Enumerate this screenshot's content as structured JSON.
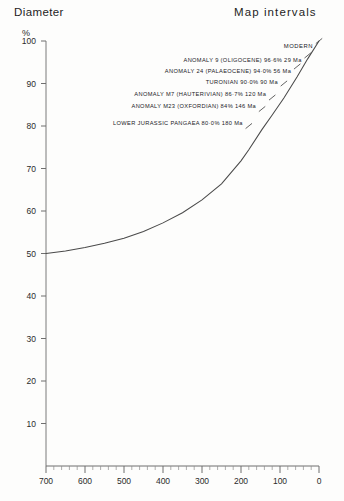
{
  "headings": {
    "left": "Diameter",
    "right": "Map  intervals"
  },
  "axes": {
    "y_unit": "%",
    "y_ticks": [
      "100",
      "90",
      "80",
      "70",
      "60",
      "50",
      "40",
      "30",
      "20",
      "10"
    ],
    "x_ticks": [
      "700",
      "600",
      "500",
      "400",
      "300",
      "200",
      "100",
      "0"
    ]
  },
  "annotations": [
    {
      "label": "MODERN",
      "marker": "tick-mark"
    },
    {
      "label": "ANOMALY 9 (OLIGOCENE) 96·6% 29 Ma",
      "marker": "tick-mark"
    },
    {
      "label": "ANOMALY 24 (PALAEOCENE) 94·0% 56 Ma",
      "marker": "tick-mark"
    },
    {
      "label": "TURONIAN  90·0% 90 Ma",
      "marker": "tick-mark"
    },
    {
      "label": "ANOMALY M7 (HAUTERIVIAN) 86·7% 120 Ma",
      "marker": "tick-mark"
    },
    {
      "label": "ANOMALY M23 (OXFORDIAN) 84% 146 Ma",
      "marker": "tick-mark"
    },
    {
      "label": "LOWER JURASSIC PANGAEA 80·0% 180 Ma",
      "marker": "tick-mark"
    }
  ],
  "chart_data": {
    "type": "line",
    "title": "Diameter",
    "subtitle": "Map intervals",
    "xlabel": "",
    "ylabel": "%",
    "xlim": [
      700,
      0
    ],
    "ylim": [
      0,
      100
    ],
    "x_reversed": true,
    "grid": false,
    "legend_position": "none",
    "series": [
      {
        "name": "Diameter",
        "x": [
          700,
          650,
          600,
          550,
          500,
          450,
          400,
          350,
          300,
          250,
          200,
          180,
          146,
          120,
          90,
          56,
          29,
          0
        ],
        "y": [
          50.0,
          50.6,
          51.4,
          52.4,
          53.6,
          55.2,
          57.2,
          59.6,
          62.6,
          66.4,
          71.8,
          74.4,
          79.2,
          82.6,
          86.6,
          91.6,
          95.8,
          100.0
        ]
      }
    ],
    "annotated_points": [
      {
        "label": "MODERN",
        "x": 0,
        "y": 100.0
      },
      {
        "label": "ANOMALY 9 (OLIGOCENE)",
        "x": 29,
        "y": 96.6,
        "age_ma": 29,
        "percent": 96.6
      },
      {
        "label": "ANOMALY 24 (PALAEOCENE)",
        "x": 56,
        "y": 94.0,
        "age_ma": 56,
        "percent": 94.0
      },
      {
        "label": "TURONIAN",
        "x": 90,
        "y": 90.0,
        "age_ma": 90,
        "percent": 90.0
      },
      {
        "label": "ANOMALY M7 (HAUTERIVIAN)",
        "x": 120,
        "y": 86.7,
        "age_ma": 120,
        "percent": 86.7
      },
      {
        "label": "ANOMALY M23 (OXFORDIAN)",
        "x": 146,
        "y": 84.0,
        "age_ma": 146,
        "percent": 84.0
      },
      {
        "label": "LOWER JURASSIC PANGAEA",
        "x": 180,
        "y": 80.0,
        "age_ma": 180,
        "percent": 80.0
      }
    ]
  },
  "colors": {
    "ink": "#2b2b2b",
    "axis": "#6f6f6f",
    "curve": "#4a4a4a",
    "paper": "#fdfdfc"
  }
}
